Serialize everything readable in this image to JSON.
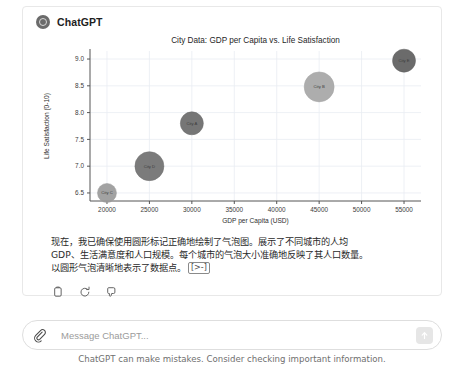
{
  "assistant": {
    "name": "ChatGPT",
    "avatar_icon": "chatgpt-logo-icon"
  },
  "message": {
    "line1": "现在，我已确保使用圆形标记正确地绘制了气泡图。展示了不同城市的人均",
    "line2": "GDP、生活满意度和人口规模。每个城市的气泡大小准确地反映了其人口数量。",
    "line3": "以圆形气泡清晰地表示了数据点。",
    "cursor_token": "[>-]"
  },
  "actions": [
    {
      "name": "copy-icon",
      "label": "Copy"
    },
    {
      "name": "regenerate-icon",
      "label": "Regenerate"
    },
    {
      "name": "thumbs-down-icon",
      "label": "Bad response"
    }
  ],
  "composer": {
    "attach_icon": "paperclip-icon",
    "placeholder": "Message ChatGPT...",
    "value": "",
    "send_icon": "arrow-up-icon"
  },
  "footnote": "ChatGPT can make mistakes. Consider checking important information.",
  "chart_data": {
    "type": "scatter",
    "title": "City Data: GDP per Capita vs. Life Satisfaction",
    "xlabel": "GDP per Capita (USD)",
    "ylabel": "Life Satisfaction (0-10)",
    "xlim": [
      18000,
      57000
    ],
    "ylim": [
      6.35,
      9.15
    ],
    "xticks": [
      20000,
      25000,
      30000,
      35000,
      40000,
      45000,
      50000,
      55000
    ],
    "xtick_labels": [
      "20000",
      "25000",
      "30000",
      "35000",
      "40000",
      "45000",
      "50000",
      "55000"
    ],
    "yticks": [
      6.5,
      7.0,
      7.5,
      8.0,
      8.5,
      9.0
    ],
    "ytick_labels": [
      "6.5",
      "7.0",
      "7.5",
      "8.0",
      "8.5",
      "9.0"
    ],
    "grid": true,
    "legend": "none",
    "size_encodes": "population",
    "points": [
      {
        "label": "City C",
        "x": 20000,
        "y": 6.5,
        "r": 9.5,
        "color": "#9a9a9a"
      },
      {
        "label": "City D",
        "x": 25000,
        "y": 7.0,
        "r": 14.5,
        "color": "#707070"
      },
      {
        "label": "City A",
        "x": 30000,
        "y": 7.8,
        "r": 11.5,
        "color": "#6a6a6a"
      },
      {
        "label": "City B",
        "x": 45000,
        "y": 8.48,
        "r": 15.0,
        "color": "#a6a6a6"
      },
      {
        "label": "City E",
        "x": 55000,
        "y": 8.97,
        "r": 11.5,
        "color": "#5e5e5e"
      }
    ]
  }
}
